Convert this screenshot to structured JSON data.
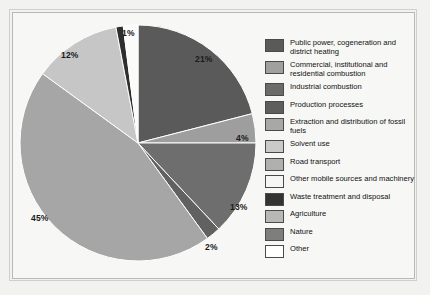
{
  "chart_data": {
    "type": "pie",
    "title": "",
    "subtitle": "",
    "xlabel": "",
    "ylabel": "",
    "legend_position": "right",
    "grid": false,
    "units": "percent",
    "categories": [
      "Public power, cogeneration and district heating",
      "Commercial, institutional and residential combustion",
      "Industrial combustion",
      "Production processes",
      "Extraction and distribution of fossil fuels",
      "Solvent use",
      "Road transport",
      "Other mobile sources and machinery",
      "Waste treatment and disposal",
      "Agriculture",
      "Nature",
      "Other"
    ],
    "values": [
      21,
      4,
      13,
      2,
      45,
      12,
      1,
      1,
      0,
      0,
      0,
      0
    ],
    "labels_shown": [
      "21%",
      "4%",
      "13%",
      "2%",
      "45%",
      "12%",
      "1%"
    ],
    "colors": [
      "#5a5a5a",
      "#9e9e9e",
      "#6e6e6e",
      "#616161",
      "#a6a6a6",
      "#bdbdbd",
      "#b0b0b0",
      "#f4f4f2",
      "#2e2e2e",
      "#b5b5b5",
      "#7c7c7c",
      "#ffffff"
    ],
    "slices": [
      {
        "name": "Public power, cogeneration and district heating",
        "value": 21,
        "label": "21%",
        "color": "#5a5a5a"
      },
      {
        "name": "Commercial, institutional and residential combustion",
        "value": 4,
        "label": "4%",
        "color": "#9e9e9e"
      },
      {
        "name": "Industrial combustion",
        "value": 13,
        "label": "13%",
        "color": "#6e6e6e"
      },
      {
        "name": "Production processes",
        "value": 2,
        "label": "2%",
        "color": "#616161"
      },
      {
        "name": "Road transport",
        "value": 45,
        "label": "45%",
        "color": "#a6a6a6"
      },
      {
        "name": "Other mobile sources and machinery",
        "value": 12,
        "label": "12%",
        "color": "#c6c6c6"
      },
      {
        "name": "Waste treatment and disposal",
        "value": 1,
        "label": "1%",
        "color": "#2e2e2e"
      },
      {
        "name": "Other",
        "value": 2,
        "label": "",
        "color": "#fbfbfa"
      }
    ]
  },
  "pct_labels": {
    "p21": "21%",
    "p4": "4%",
    "p13": "13%",
    "p2": "2%",
    "p45": "45%",
    "p12": "12%",
    "p1": "1%"
  },
  "legend": {
    "items": [
      {
        "label": "Public power, cogeneration and district heating",
        "color": "#5a5a5a"
      },
      {
        "label": "Commercial, institutional and residential combustion",
        "color": "#a0a0a0"
      },
      {
        "label": "Industrial combustion",
        "color": "#6b6b6b"
      },
      {
        "label": "Production processes",
        "color": "#5e5e5e"
      },
      {
        "label": "Extraction and distribution of fossil fuels",
        "color": "#a8a8a8"
      },
      {
        "label": "Solvent use",
        "color": "#cacaca"
      },
      {
        "label": "Road transport",
        "color": "#b0b0b0"
      },
      {
        "label": "Other mobile sources and machinery",
        "color": "#f6f6f4"
      },
      {
        "label": "Waste treatment and disposal",
        "color": "#333333"
      },
      {
        "label": "Agriculture",
        "color": "#b8b8b8"
      },
      {
        "label": "Nature",
        "color": "#7e7e7e"
      },
      {
        "label": "Other",
        "color": "#ffffff"
      }
    ]
  }
}
